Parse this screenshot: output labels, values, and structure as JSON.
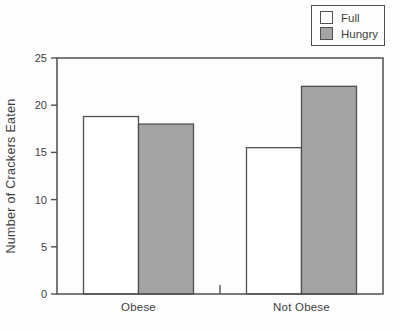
{
  "chart_data": {
    "type": "bar",
    "title": "",
    "xlabel": "",
    "ylabel": "Number of Crackers Eaten",
    "categories": [
      "Obese",
      "Not Obese"
    ],
    "series": [
      {
        "name": "Full",
        "color": "#ffffff",
        "values": [
          18.8,
          15.5
        ]
      },
      {
        "name": "Hungry",
        "color": "#a4a4a4",
        "values": [
          18,
          22
        ]
      }
    ],
    "ylim": [
      0,
      25
    ],
    "yticks": [
      0,
      5,
      10,
      15,
      20,
      25
    ],
    "grid": false,
    "legend_position": "top-right",
    "colors": {
      "stroke": "#4f4f4f",
      "text": "#3f3f3f",
      "background": "#fdfdfd"
    }
  }
}
